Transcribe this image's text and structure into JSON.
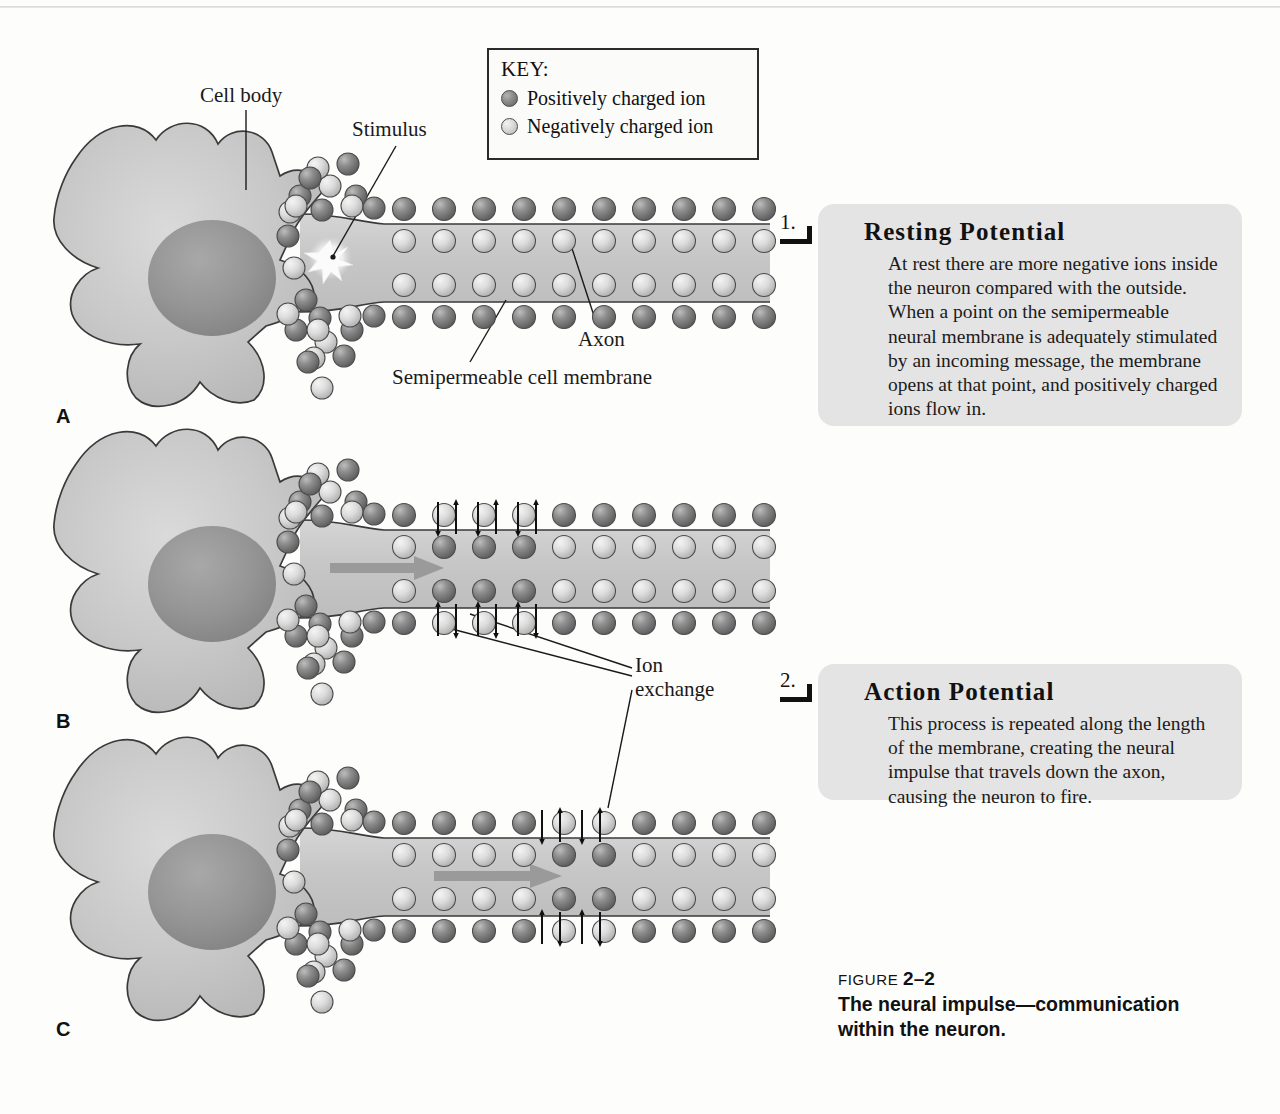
{
  "figure": {
    "number_prefix": "FIGURE",
    "number": "2–2",
    "title": "The neural impulse—communication within the neuron."
  },
  "key": {
    "title": "KEY:",
    "entries": [
      {
        "icon": "positive-ion-circle",
        "label": "Positively charged ion",
        "color": "#7d7d7d"
      },
      {
        "icon": "negative-ion-circle",
        "label": "Negatively charged ion",
        "color": "#d8d8d8"
      }
    ]
  },
  "diagram_labels": {
    "cell_body": "Cell body",
    "stimulus": "Stimulus",
    "axon": "Axon",
    "membrane": "Semipermeable cell membrane",
    "ion_exchange_line1": "Ion",
    "ion_exchange_line2": "exchange"
  },
  "panels": [
    {
      "letter": "A",
      "stage": "resting"
    },
    {
      "letter": "B",
      "stage": "depolarization-start"
    },
    {
      "letter": "C",
      "stage": "propagation"
    }
  ],
  "steps": [
    {
      "marker": "1.",
      "heading": "Resting Potential",
      "body": "At rest there are more negative ions inside the neuron compared with the outside. When a point on the semipermeable neural membrane is adequately stimulated by an incoming message, the membrane opens at that point, and positively charged ions flow in."
    },
    {
      "marker": "2.",
      "heading": "Action Potential",
      "body": "This process is repeated along the length of the membrane, creating the neural impulse that travels down the axon, causing the neuron to fire."
    }
  ],
  "colors": {
    "page_background": "#fdfdfc",
    "callout_background": "#e4e4e4",
    "cell_fill": "#c9c9c9",
    "nucleus_fill": "#9a9a9a",
    "positive_ion": "#7d7d7d",
    "negative_ion": "#d8d8d8",
    "outline": "#2b2b2b",
    "flow_arrow": "#9a9a9a"
  },
  "chart_data": {
    "type": "diagram",
    "title": "The neural impulse—communication within the neuron.",
    "panels": [
      {
        "letter": "A",
        "description": "Resting neuron: positively charged ions line the outside of the axon membrane, negatively charged ions line the inside.",
        "outer_ion": "positive",
        "inner_ion": "negative",
        "exchange_zone_x": null,
        "flow_arrow": false
      },
      {
        "letter": "B",
        "description": "Stimulated point at the start of the axon: membrane opens, positive ions move in and negative ions move out; vertical exchange arrows shown.",
        "outer_ion": "positive",
        "inner_ion": "negative",
        "exchange_zone_x": 0.1,
        "flow_arrow": true
      },
      {
        "letter": "C",
        "description": "Impulse propagates: the ion-exchange zone has moved further down the axon.",
        "outer_ion": "positive",
        "inner_ion": "negative",
        "exchange_zone_x": 0.45,
        "flow_arrow": true
      }
    ],
    "legend": [
      "Positively charged ion",
      "Negatively charged ion"
    ],
    "annotations": [
      "Cell body",
      "Stimulus",
      "Axon",
      "Semipermeable cell membrane",
      "Ion exchange"
    ]
  }
}
